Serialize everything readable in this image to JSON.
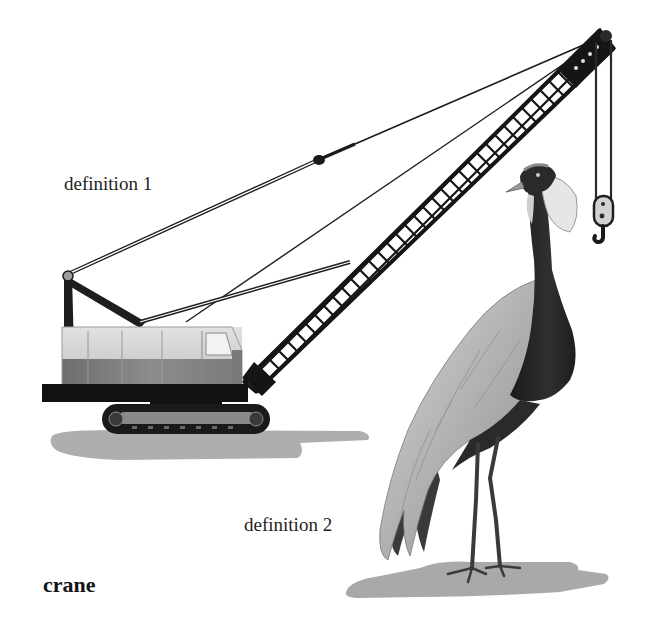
{
  "figure": {
    "headword": "crane",
    "definitions": [
      {
        "label": "definition 1",
        "depicts": "construction crane (crawler crane with lattice boom and hook)"
      },
      {
        "label": "definition 2",
        "depicts": "crane bird (long-legged wading bird)"
      }
    ]
  },
  "palette": {
    "background": "#ffffff",
    "ink": "#141414",
    "cab_light": "#d4d4d4",
    "cab_dark": "#8a8a8a",
    "shadow": "#9a9a9a",
    "bird_plumage": "#a9a9a9",
    "bird_neck": "#2a2a2a"
  }
}
